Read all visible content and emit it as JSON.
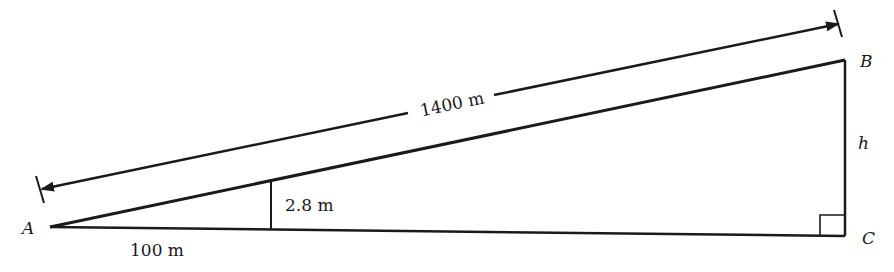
{
  "diagram": {
    "type": "right-triangle-slope",
    "vertices": {
      "A": {
        "label": "A"
      },
      "B": {
        "label": "B"
      },
      "C": {
        "label": "C"
      }
    },
    "labels": {
      "hypotenuse_length": "1400 m",
      "small_height": "2.8 m",
      "small_base": "100 m",
      "height": "h",
      "vertex_a": "A",
      "vertex_b": "B",
      "vertex_c": "C"
    },
    "stroke_color": "#1a1a1a",
    "background": "#ffffff"
  }
}
